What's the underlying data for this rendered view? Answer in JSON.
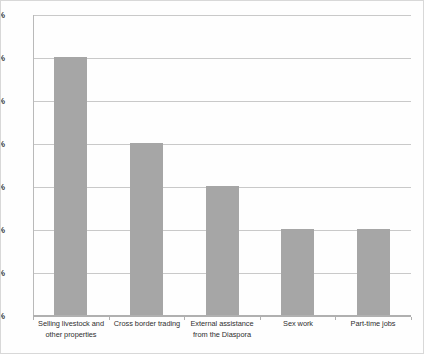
{
  "chart_data": {
    "type": "bar",
    "title": "",
    "subtitle": "",
    "xlabel": "",
    "ylabel": "",
    "categories": [
      "Selling livestock and other properties",
      "Cross border trading",
      "External assistance from the Diaspora",
      "Sex work",
      "Part-time jobs"
    ],
    "category_lines": [
      [
        "Selling livestock and",
        "other properties"
      ],
      [
        "Cross border trading"
      ],
      [
        "External assistance",
        "from the Diaspora"
      ],
      [
        "Sex work"
      ],
      [
        "Part-time jobs"
      ]
    ],
    "values": [
      30,
      20,
      15,
      10,
      10
    ],
    "value_labels": [
      "30%",
      "20%",
      "15%",
      "10%",
      "10%"
    ],
    "ylim": [
      0,
      35
    ],
    "ytick_values": [
      0,
      5,
      10,
      15,
      20,
      25,
      30,
      35
    ],
    "ytick_labels": [
      "0%",
      "5%",
      "10%",
      "15%",
      "20%",
      "25%",
      "30%",
      "35%"
    ],
    "grid": true,
    "legend": false,
    "legend_position": "none",
    "series_color": "#a6a6a6",
    "gridline_color": "#c9c9c9",
    "axis_color": "#b0b0b0",
    "background_color": "#ffffff"
  }
}
